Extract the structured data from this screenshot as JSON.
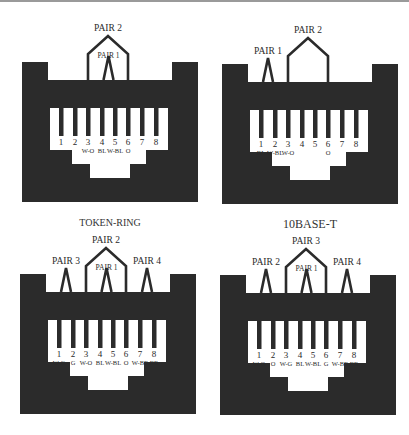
{
  "colors": {
    "jack_body": "#2b2b2b",
    "window": "#ffffff",
    "text": "#2a2a2a",
    "top_border": "#9a9a9a"
  },
  "diagrams": [
    {
      "id": "token-ring",
      "caption": "TOKEN-RING",
      "pin_numbers": [
        "1",
        "2",
        "3",
        "4",
        "5",
        "6",
        "7",
        "8"
      ],
      "wire_labels": [
        "",
        "",
        "W-O",
        "BL",
        "W-BL",
        "O",
        "",
        ""
      ],
      "pairs": [
        {
          "label": "PAIR 2",
          "pins": [
            3,
            6
          ]
        },
        {
          "label": "PAIR 1",
          "pins": [
            4,
            5
          ]
        }
      ]
    },
    {
      "id": "10base-t",
      "caption": "10BASE-T",
      "pin_numbers": [
        "1",
        "2",
        "3",
        "4",
        "5",
        "6",
        "7",
        "8"
      ],
      "wire_labels": [
        "BL",
        "W-BL",
        "W-O",
        "",
        "",
        "O",
        "",
        ""
      ],
      "pairs": [
        {
          "label": "PAIR 1",
          "pins": [
            1,
            2
          ]
        },
        {
          "label": "PAIR 2",
          "pins": [
            3,
            6
          ]
        }
      ]
    },
    {
      "id": "t568a-style",
      "caption": "",
      "pin_numbers": [
        "1",
        "2",
        "3",
        "4",
        "5",
        "6",
        "7",
        "8"
      ],
      "wire_labels": [
        "W-G",
        "G",
        "W-O",
        "BL",
        "W-BL",
        "O",
        "W-BR",
        "BR"
      ],
      "pairs": [
        {
          "label": "PAIR 3",
          "pins": [
            1,
            2
          ]
        },
        {
          "label": "PAIR 2",
          "pins": [
            3,
            6
          ]
        },
        {
          "label": "PAIR 1",
          "pins": [
            4,
            5
          ]
        },
        {
          "label": "PAIR 4",
          "pins": [
            7,
            8
          ]
        }
      ]
    },
    {
      "id": "t568b-style",
      "caption": "",
      "pin_numbers": [
        "1",
        "2",
        "3",
        "4",
        "5",
        "6",
        "7",
        "8"
      ],
      "wire_labels": [
        "W-O",
        "O",
        "W-G",
        "BL",
        "W-BL",
        "G",
        "W-BR",
        "BR"
      ],
      "pairs": [
        {
          "label": "PAIR 2",
          "pins": [
            1,
            2
          ]
        },
        {
          "label": "PAIR 3",
          "pins": [
            3,
            6
          ]
        },
        {
          "label": "PAIR 1",
          "pins": [
            4,
            5
          ]
        },
        {
          "label": "PAIR 4",
          "pins": [
            7,
            8
          ]
        }
      ]
    }
  ]
}
